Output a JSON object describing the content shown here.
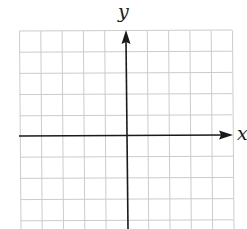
{
  "figure": {
    "type": "blank coordinate grid",
    "axes": {
      "x_label": "x",
      "y_label": "y"
    },
    "grid": {
      "columns": 10,
      "rows_visible": 9,
      "line_color": "#cfcfcf",
      "axis_color": "#1a1a1a"
    }
  }
}
